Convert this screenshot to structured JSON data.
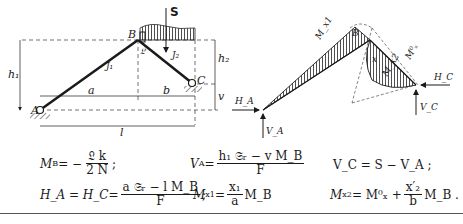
{
  "left_figure": {
    "labels": {
      "load": "S",
      "node_b": "B",
      "node_a": "A",
      "node_c": "C",
      "member_1": "J₁",
      "member_2": "J₂",
      "height_1": "h₁",
      "height_2": "h₂",
      "offset_v": "v",
      "span_a": "a",
      "span_b": "b",
      "span_l": "l",
      "hinge_symbol": "𝔏"
    }
  },
  "right_figure": {
    "labels": {
      "moment_x1": "M_x1",
      "node_b": "B",
      "moment_x2": "M_x2",
      "moment_zero": "M⁰ₓ",
      "section_x": "x",
      "reaction_ha": "H_A",
      "reaction_va": "V_A",
      "reaction_hc": "H_C",
      "reaction_vc": "V_C"
    }
  },
  "equations": {
    "mb": {
      "lhs": "M",
      "lhs_sub": "B",
      "op": " = − ",
      "num": "𝔏 k",
      "den": "2 N",
      "end": ";"
    },
    "va": {
      "lhs": "V",
      "lhs_sub": "A",
      "op": " = ",
      "num": "h₁ 𝔖ᵣ − v M_B",
      "den": "F"
    },
    "vc": {
      "text": "V_C = S − V_A ;"
    },
    "ha": {
      "lhs": "H_A = H_C",
      "op": " = ",
      "num": "a 𝔖ᵣ − l M_B",
      "den": "F",
      "end": ";"
    },
    "mx1": {
      "lhs": "M",
      "lhs_sub": "x1",
      "op": " = ",
      "num": "x₁",
      "den": "a",
      "tail": " M_B"
    },
    "mx2": {
      "lhs": "M",
      "lhs_sub": "x2",
      "op": " = M⁰ₓ + ",
      "num": "x′₂",
      "den": "b",
      "tail": " M_B ."
    }
  }
}
